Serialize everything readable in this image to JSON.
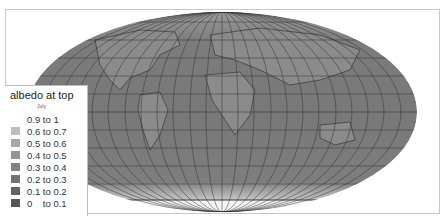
{
  "map": {
    "projection": "Mollweide-like world map",
    "legend": {
      "title": "albedo at top",
      "subtitle": "July",
      "items": [
        {
          "label": "0.9 to 1",
          "color": "#ffffff"
        },
        {
          "label": "0.6 to 0.7",
          "color": "#bdbdbd"
        },
        {
          "label": "0.5 to 0.6",
          "color": "#a8a8a8"
        },
        {
          "label": "0.4 to 0.5",
          "color": "#959595"
        },
        {
          "label": "0.3 to 0.4",
          "color": "#838383"
        },
        {
          "label": "0.2 to 0.3",
          "color": "#727272"
        },
        {
          "label": "0.1 to 0.2",
          "color": "#636363"
        },
        {
          "label": "0    to 0.1",
          "color": "#565656"
        }
      ]
    },
    "colors": {
      "ocean": "#7a7a7a",
      "land": "#8a8a8a",
      "graticule": "#333333",
      "coast": "#222222",
      "frame": "#c8c8c8"
    }
  }
}
